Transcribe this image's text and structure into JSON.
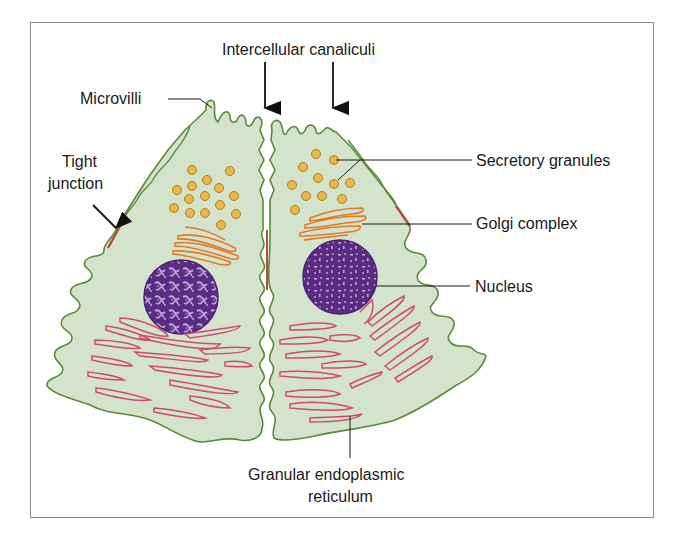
{
  "figure": {
    "type": "biological-diagram"
  },
  "labels": {
    "intercellular_canaliculi": "Intercellular canaliculi",
    "microvilli": "Microvilli",
    "tight_junction_line1": "Tight",
    "tight_junction_line2": "junction",
    "secretory_granules": "Secretory granules",
    "golgi_complex": "Golgi complex",
    "nucleus": "Nucleus",
    "granular_er_line1": "Granular endoplasmic",
    "granular_er_line2": "reticulum"
  },
  "colors": {
    "cytoplasm": "#d4e3cc",
    "membrane": "#5a8a3c",
    "granule_fill": "#e8b84a",
    "granule_stroke": "#b87a1a",
    "golgi": "#e07a2a",
    "nucleus": "#5a2d82",
    "chromatin": "#c0a8d8",
    "er": "#d04a6e",
    "tight_junction": "#b0503a",
    "frame": "#8a8a8a",
    "text": "#1a1a1a"
  }
}
